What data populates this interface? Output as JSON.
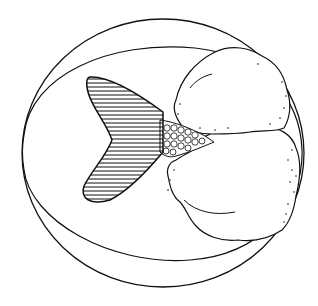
{
  "illustration": {
    "subject": "fish tail inside a circle with cloud-like masses",
    "ink_color": "#111111",
    "paper_color": "#ffffff",
    "elements": [
      {
        "name": "outer-circle"
      },
      {
        "name": "inner-ellipse"
      },
      {
        "name": "fish-tail"
      },
      {
        "name": "scaled-peduncle"
      },
      {
        "name": "upper-cloud"
      },
      {
        "name": "lower-cloud"
      }
    ]
  }
}
